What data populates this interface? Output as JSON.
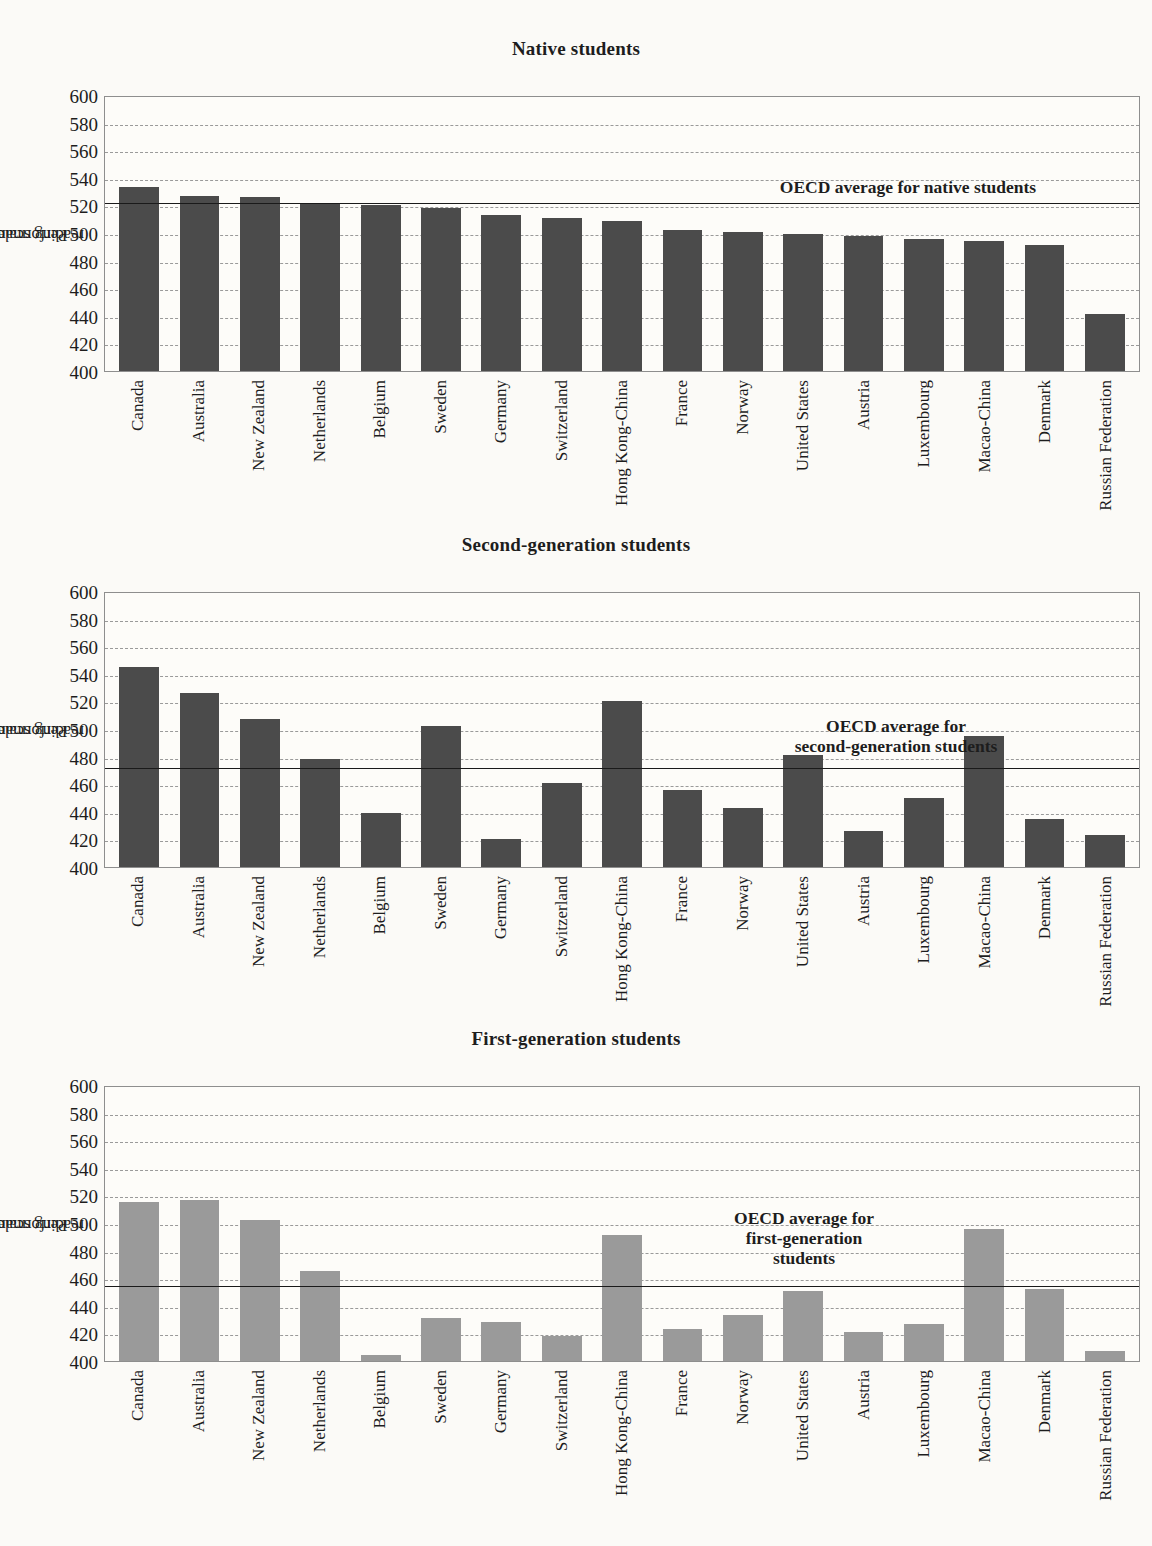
{
  "figure": {
    "ylabel": "Performance on the\nreading scale",
    "ylabel_line1": "Performance on the",
    "ylabel_line2": "reading scale",
    "yticks": [
      600,
      580,
      560,
      540,
      520,
      500,
      480,
      460,
      440,
      420,
      400
    ],
    "bar_color_dark": "#4b4b4b",
    "bar_color_light": "#9a9a9a",
    "grid": true,
    "ymin": 400,
    "ymax": 600
  },
  "chart_data": [
    {
      "type": "bar",
      "title": "Native students",
      "xlabel": "",
      "ylabel": "Performance on the reading scale",
      "ylim": [
        400,
        600
      ],
      "categories": [
        "Canada",
        "Australia",
        "New Zealand",
        "Netherlands",
        "Belgium",
        "Sweden",
        "Germany",
        "Switzerland",
        "Hong Kong-China",
        "France",
        "Norway",
        "United States",
        "Austria",
        "Luxembourg",
        "Macao-China",
        "Denmark",
        "Russian Federation"
      ],
      "values": [
        533,
        527,
        526,
        522,
        520,
        518,
        513,
        511,
        509,
        502,
        501,
        499,
        498,
        496,
        494,
        491,
        441
      ],
      "reference_line": {
        "label": "OECD average for native students",
        "value": 523
      },
      "grid": true,
      "legend": "none"
    },
    {
      "type": "bar",
      "title": "Second-generation students",
      "xlabel": "",
      "ylabel": "Performance on the reading scale",
      "ylim": [
        400,
        600
      ],
      "categories": [
        "Canada",
        "Australia",
        "New Zealand",
        "Netherlands",
        "Belgium",
        "Sweden",
        "Germany",
        "Switzerland",
        "Hong Kong-China",
        "France",
        "Norway",
        "United States",
        "Austria",
        "Luxembourg",
        "Macao-China",
        "Denmark",
        "Russian Federation"
      ],
      "values": [
        545,
        526,
        507,
        478,
        439,
        502,
        420,
        461,
        520,
        456,
        443,
        481,
        426,
        450,
        495,
        435,
        423
      ],
      "reference_line": {
        "label": "OECD average for\nsecond-generation students",
        "value": 473
      },
      "grid": true,
      "legend": "none"
    },
    {
      "type": "bar",
      "title": "First-generation students",
      "xlabel": "",
      "ylabel": "Performance on the reading scale",
      "ylim": [
        400,
        600
      ],
      "categories": [
        "Canada",
        "Australia",
        "New Zealand",
        "Netherlands",
        "Belgium",
        "Sweden",
        "Germany",
        "Switzerland",
        "Hong Kong-China",
        "France",
        "Norway",
        "United States",
        "Austria",
        "Luxembourg",
        "Macao-China",
        "Denmark",
        "Russian Federation"
      ],
      "values": [
        515,
        517,
        502,
        465,
        404,
        431,
        428,
        418,
        491,
        423,
        433,
        451,
        421,
        427,
        496,
        452,
        407
      ],
      "reference_line": {
        "label": "OECD average for\nfirst-generation\nstudents",
        "value": 456
      },
      "grid": true,
      "legend": "none"
    }
  ]
}
